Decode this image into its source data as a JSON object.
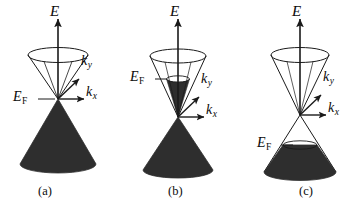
{
  "figure": {
    "type": "scientific-diagram",
    "background_color": "#ffffff",
    "line_color": "#1a1a1a",
    "fill_color": "#2e2e2e",
    "panels": [
      {
        "id": "a",
        "caption": "(a)",
        "caption_x": 45,
        "caption_y": 193,
        "dirac_point": {
          "x": 58,
          "y": 99
        },
        "energy_axis": {
          "label": "E",
          "label_x": 50,
          "label_y": 6,
          "tip_x": 58,
          "tip_y": 18,
          "base_x": 58,
          "base_y": 99
        },
        "ky_axis": {
          "label": "k",
          "subscript": "y",
          "label_x": 81,
          "label_y": 60,
          "tip_x": 80,
          "tip_y": 78
        },
        "kx_axis": {
          "label": "k",
          "subscript": "x",
          "label_x": 86,
          "label_y": 90,
          "tip_x": 85,
          "tip_y": 99
        },
        "fermi": {
          "label": "E",
          "subscript": "F",
          "label_x": 14,
          "label_y": 91,
          "level_y": 99,
          "tick_from_x": 38,
          "tick_to_x": 52,
          "description": "Fermi level exactly at the Dirac point"
        },
        "upper_cone": {
          "apex_x": 58,
          "apex_y": 99,
          "rim_y": 55,
          "rim_rx": 30,
          "rim_ry": 7.5,
          "filled": false
        },
        "lower_cone": {
          "apex_x": 58,
          "apex_y": 99,
          "rim_y": 164,
          "rim_rx": 38,
          "rim_ry": 9,
          "filled": true,
          "fill_from_y": 99
        }
      },
      {
        "id": "b",
        "caption": "(b)",
        "caption_x": 175,
        "caption_y": 193,
        "dirac_point": {
          "x": 178,
          "y": 117
        },
        "energy_axis": {
          "label": "E",
          "label_x": 170,
          "label_y": 6,
          "tip_x": 178,
          "tip_y": 18,
          "base_x": 178,
          "base_y": 117
        },
        "ky_axis": {
          "label": "k",
          "subscript": "y",
          "label_x": 201,
          "label_y": 78,
          "tip_x": 200,
          "tip_y": 96
        },
        "kx_axis": {
          "label": "k",
          "subscript": "x",
          "label_x": 206,
          "label_y": 108,
          "tip_x": 205,
          "tip_y": 117
        },
        "fermi": {
          "label": "E",
          "subscript": "F",
          "label_x": 131,
          "label_y": 71,
          "level_y": 79,
          "tick_from_x": 155,
          "tick_to_x": 167,
          "description": "Fermi level above the Dirac point: electron doped"
        },
        "upper_cone": {
          "apex_x": 178,
          "apex_y": 117,
          "rim_y": 56,
          "rim_rx": 28,
          "rim_ry": 7,
          "filled": false,
          "fill_to_y": 79,
          "fill_rx_at_level": 11.5,
          "fill_ry_at_level": 3.2
        },
        "lower_cone": {
          "apex_x": 178,
          "apex_y": 117,
          "rim_y": 170,
          "rim_rx": 35,
          "rim_ry": 8,
          "filled": true,
          "fill_from_y": 117
        }
      },
      {
        "id": "c",
        "caption": "(c)",
        "caption_x": 305,
        "caption_y": 193,
        "dirac_point": {
          "x": 300,
          "y": 115
        },
        "energy_axis": {
          "label": "E",
          "label_x": 292,
          "label_y": 6,
          "tip_x": 300,
          "tip_y": 18,
          "base_x": 300,
          "base_y": 115
        },
        "ky_axis": {
          "label": "k",
          "subscript": "y",
          "label_x": 323,
          "label_y": 76,
          "tip_x": 322,
          "tip_y": 94
        },
        "kx_axis": {
          "label": "k",
          "subscript": "x",
          "label_x": 328,
          "label_y": 106,
          "tip_x": 327,
          "tip_y": 115
        },
        "fermi": {
          "label": "E",
          "subscript": "F",
          "label_x": 258,
          "label_y": 137,
          "level_y": 145,
          "tick_from_x": 281,
          "tick_to_x": 292,
          "description": "Fermi level below the Dirac point: hole doped"
        },
        "upper_cone": {
          "apex_x": 300,
          "apex_y": 115,
          "rim_y": 55,
          "rim_rx": 29,
          "rim_ry": 7.5,
          "filled": false
        },
        "lower_cone": {
          "apex_x": 300,
          "apex_y": 115,
          "rim_y": 172,
          "rim_rx": 36,
          "rim_ry": 8.5,
          "filled": true,
          "fill_from_y": 145,
          "fill_rx_at_level": 17,
          "fill_ry_at_level": 4.2
        }
      }
    ]
  }
}
